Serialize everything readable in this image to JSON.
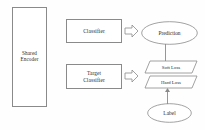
{
  "diagram": {
    "stroke_color": "#8a8a8a",
    "text_color": "#2b2b2b",
    "background_color": "#fefefe",
    "nodes": {
      "shared_encoder": {
        "label": "Shared\nEncoder",
        "shape": "rectangle"
      },
      "classifier": {
        "label": "Classifier",
        "shape": "rectangle"
      },
      "target_classifier": {
        "label": "Target\nClassifier",
        "shape": "rectangle"
      },
      "prediction": {
        "label": "Prediction",
        "shape": "ellipse"
      },
      "soft_loss": {
        "label": "Soft Loss",
        "shape": "parallelogram"
      },
      "hard_loss": {
        "label": "Hard Loss",
        "shape": "parallelogram"
      },
      "label_node": {
        "label": "Label",
        "shape": "ellipse"
      }
    },
    "connectors": {
      "classifier_to_prediction": {
        "style": "block-arrow",
        "direction": "right"
      },
      "target_classifier_to_losses": {
        "style": "block-arrow",
        "direction": "right"
      },
      "prediction_to_soft_loss": {
        "style": "line",
        "direction": "down"
      },
      "label_to_hard_loss": {
        "style": "arrow",
        "direction": "up"
      }
    }
  }
}
